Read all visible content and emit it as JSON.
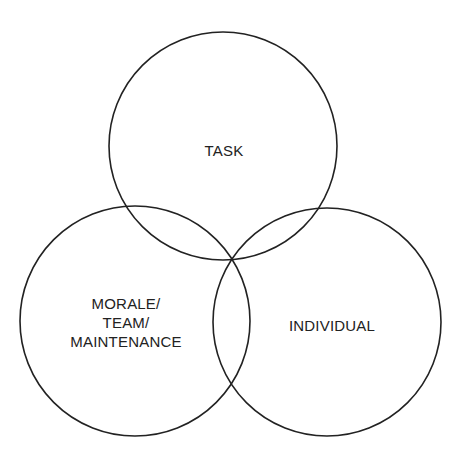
{
  "diagram": {
    "type": "venn",
    "stroke_color": "#222222",
    "circles": [
      {
        "id": "task",
        "label": "TASK",
        "cx": 223,
        "cy": 146,
        "r": 114
      },
      {
        "id": "team",
        "label": "MORALE/\nTEAM/\nMAINTENANCE",
        "lines": [
          "MORALE/",
          "TEAM/",
          "MAINTENANCE"
        ],
        "cx": 135,
        "cy": 321,
        "r": 115
      },
      {
        "id": "individual",
        "label": "INDIVIDUAL",
        "cx": 327,
        "cy": 322,
        "r": 114
      }
    ]
  }
}
